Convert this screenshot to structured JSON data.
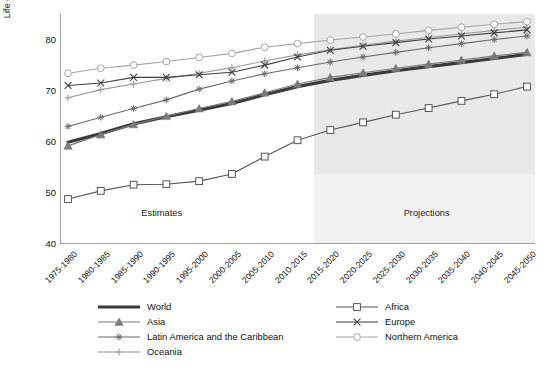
{
  "chart_data": {
    "type": "line",
    "title": "",
    "xlabel": "",
    "ylabel": "Life expectancy at birth (years)",
    "ylim": [
      40,
      85
    ],
    "yticks": [
      40,
      50,
      60,
      70,
      80
    ],
    "grid": false,
    "legend_position": "bottom",
    "categories": [
      "1975-1980",
      "1980-1985",
      "1985-1990",
      "1990-1995",
      "1995-2000",
      "2000-2005",
      "2005-2010",
      "2010-2015",
      "2015-2020",
      "2020-2025",
      "2025-2030",
      "2030-2035",
      "2035-2040",
      "2040-2045",
      "2045-2050"
    ],
    "annotations": [
      {
        "text": "Estimates",
        "x_category": "1990-1995"
      },
      {
        "text": "Projections",
        "x_category": "2030-2035"
      }
    ],
    "shaded_region": {
      "label": "Projections",
      "from_category": "2015-2020",
      "to_category": "2045-2050",
      "color": "#e9e9e9"
    },
    "series": [
      {
        "name": "World",
        "marker": "none",
        "color": "#3b3b3b",
        "linewidth": 3.2,
        "values": [
          59.9,
          61.6,
          63.5,
          64.9,
          66.2,
          67.5,
          69.2,
          70.8,
          72.0,
          73.0,
          73.9,
          74.7,
          75.5,
          76.3,
          77.1
        ]
      },
      {
        "name": "Asia",
        "marker": "triangle",
        "color": "#7a7a7a",
        "linewidth": 1.1,
        "values": [
          59.2,
          61.4,
          63.4,
          65.0,
          66.5,
          67.9,
          69.6,
          71.3,
          72.6,
          73.5,
          74.4,
          75.2,
          76.0,
          76.8,
          77.5
        ]
      },
      {
        "name": "Latin America and the Caribbean",
        "marker": "asterisk",
        "color": "#6a6a6a",
        "linewidth": 1.1,
        "values": [
          63.0,
          64.8,
          66.5,
          68.2,
          70.3,
          71.9,
          73.3,
          74.5,
          75.6,
          76.6,
          77.5,
          78.4,
          79.2,
          80.0,
          80.7
        ]
      },
      {
        "name": "Oceania",
        "marker": "plus",
        "color": "#9a9a9a",
        "linewidth": 1.1,
        "values": [
          68.6,
          70.2,
          71.3,
          72.4,
          73.4,
          74.5,
          75.8,
          77.0,
          78.0,
          78.9,
          79.7,
          80.4,
          81.1,
          81.8,
          82.4
        ]
      },
      {
        "name": "Africa",
        "marker": "square",
        "color": "#555555",
        "linewidth": 1.1,
        "values": [
          48.8,
          50.4,
          51.6,
          51.7,
          52.3,
          53.7,
          57.1,
          60.3,
          62.3,
          63.8,
          65.3,
          66.6,
          68.0,
          69.3,
          70.8
        ]
      },
      {
        "name": "Europe",
        "marker": "x",
        "color": "#3f3f3f",
        "linewidth": 1.1,
        "values": [
          71.0,
          71.5,
          72.6,
          72.6,
          73.1,
          73.6,
          75.0,
          76.6,
          77.9,
          78.7,
          79.4,
          80.1,
          80.7,
          81.3,
          81.9
        ]
      },
      {
        "name": "Northern America",
        "marker": "circle",
        "color": "#a5a5a5",
        "linewidth": 1.1,
        "values": [
          73.4,
          74.4,
          75.0,
          75.7,
          76.5,
          77.3,
          78.5,
          79.2,
          79.9,
          80.5,
          81.1,
          81.8,
          82.4,
          83.0,
          83.5
        ]
      }
    ]
  },
  "legend": {
    "entries": [
      {
        "label": "World",
        "col": 1,
        "row": 0
      },
      {
        "label": "Africa",
        "col": 2,
        "row": 0
      },
      {
        "label": "Asia",
        "col": 1,
        "row": 1
      },
      {
        "label": "Europe",
        "col": 2,
        "row": 1
      },
      {
        "label": "Latin America and the Caribbean",
        "col": 1,
        "row": 2
      },
      {
        "label": "Northern America",
        "col": 2,
        "row": 2
      },
      {
        "label": "Oceania",
        "col": 1,
        "row": 3
      }
    ]
  }
}
